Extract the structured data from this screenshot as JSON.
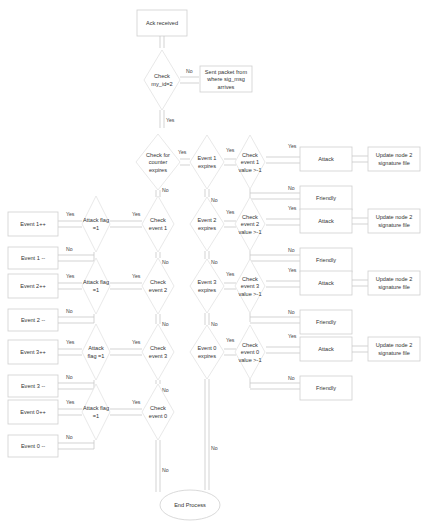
{
  "diagram": {
    "start": "Ack received",
    "check_id": [
      "Check",
      "my_id=2"
    ],
    "sent_packet": [
      "Sent packet from",
      "where sig_msg",
      "arrives"
    ],
    "check_counter": [
      "Check for",
      "counter",
      "expires"
    ],
    "end": "End Process",
    "labels": {
      "yes": "Yes",
      "no": "No"
    },
    "event_expires": [
      {
        "name": [
          "Event 1",
          "expires"
        ],
        "check": [
          "Check",
          "event 1",
          "value >-1"
        ]
      },
      {
        "name": [
          "Event 2",
          "expires"
        ],
        "check": [
          "Check",
          "event 2",
          "value >-1"
        ]
      },
      {
        "name": [
          "Event 3",
          "expires"
        ],
        "check": [
          "Check",
          "event 3",
          "value >-1"
        ]
      },
      {
        "name": [
          "Event 0",
          "expires"
        ],
        "check": [
          "Check",
          "event 0",
          "value >-1"
        ]
      }
    ],
    "outcomes": {
      "attack": "Attack",
      "friendly": "Friendly",
      "update": [
        "Update node 2",
        "signature file"
      ]
    },
    "left_events": [
      {
        "check": [
          "Check",
          "event 1"
        ],
        "flag": [
          "Attack flag",
          "=1"
        ],
        "inc": "Event 1++",
        "dec": "Event 1 --"
      },
      {
        "check": [
          "Check",
          "event 2"
        ],
        "flag": [
          "Attack flag",
          "=1"
        ],
        "inc": "Event 2++",
        "dec": "Event 2 --"
      },
      {
        "check": [
          "Check",
          "event 3"
        ],
        "flag": [
          "Attack",
          "flag =1"
        ],
        "inc": "Event 3++",
        "dec": "Event 3 --"
      },
      {
        "check": [
          "Check",
          "event 0"
        ],
        "flag": [
          "Attack flag",
          "=1"
        ],
        "inc": "Event 0++",
        "dec": "Event 0 --"
      }
    ]
  }
}
